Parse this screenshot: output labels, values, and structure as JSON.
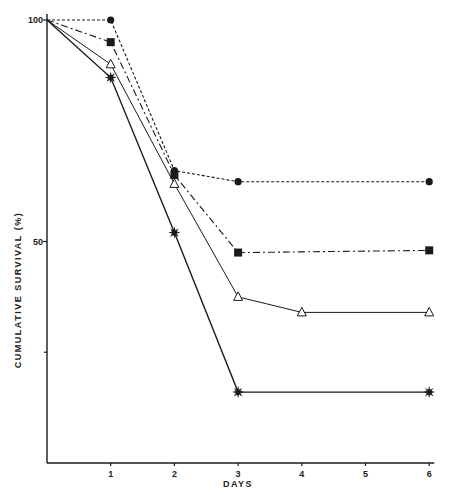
{
  "chart_data": {
    "type": "line",
    "title": "",
    "xlabel": "DAYS",
    "ylabel": "CUMULATIVE   SURVIVAL   (%)",
    "xlim": [
      0,
      6
    ],
    "ylim": [
      0,
      100
    ],
    "x_ticks": [
      1,
      2,
      3,
      4,
      5,
      6
    ],
    "y_tick_labels": [
      {
        "value": 100,
        "label": "100"
      },
      {
        "value": 50,
        "label": "50"
      }
    ],
    "y_minor_ticks": [
      25
    ],
    "grid": false,
    "legend": null,
    "series": [
      {
        "name": "circle (dashed)",
        "marker": "circle",
        "line": "dashed",
        "x": [
          0,
          1,
          2,
          3,
          6
        ],
        "y": [
          100,
          100,
          66,
          63.5,
          63.5
        ]
      },
      {
        "name": "square (dash-dot)",
        "marker": "square",
        "line": "dashdot",
        "x": [
          0,
          1,
          2,
          3,
          6
        ],
        "y": [
          100,
          95,
          65,
          47.5,
          48
        ]
      },
      {
        "name": "open triangle (solid)",
        "marker": "triangle-open",
        "line": "solid-thin",
        "x": [
          0,
          1,
          2,
          3,
          4,
          6
        ],
        "y": [
          100,
          90,
          63,
          37.5,
          34,
          34
        ]
      },
      {
        "name": "star (solid)",
        "marker": "star",
        "line": "solid",
        "x": [
          0,
          1,
          2,
          3,
          6
        ],
        "y": [
          100,
          87,
          52,
          16,
          16
        ]
      }
    ]
  },
  "labels": {
    "xlabel": "DAYS",
    "ylabel": "CUMULATIVE   SURVIVAL   (%)"
  }
}
